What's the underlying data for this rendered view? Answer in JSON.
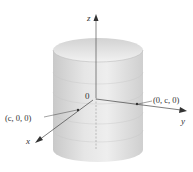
{
  "figure": {
    "axes": {
      "x_label": "x",
      "y_label": "y",
      "z_label": "z",
      "origin_label": "0"
    },
    "points": [
      {
        "label": "(c, 0, 0)"
      },
      {
        "label": "(0, c, 0)"
      }
    ],
    "colors": {
      "cylinder_fill": "#d6d6d6",
      "cylinder_light": "#ececec",
      "axis": "#555555",
      "text": "#333333"
    }
  }
}
